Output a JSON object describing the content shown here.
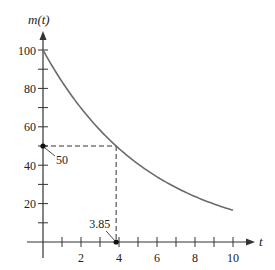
{
  "chart_data": {
    "type": "line",
    "title": "",
    "xlabel": "t",
    "ylabel": "m(t)",
    "xlim": [
      0,
      10
    ],
    "ylim": [
      0,
      100
    ],
    "x_ticks": [
      1,
      2,
      3,
      4,
      5,
      6,
      7,
      8,
      9,
      10
    ],
    "x_tick_labels": [
      "2",
      "4",
      "6",
      "8",
      "10"
    ],
    "x_tick_label_values": [
      2,
      4,
      6,
      8,
      10
    ],
    "y_ticks": [
      10,
      20,
      30,
      40,
      50,
      60,
      70,
      80,
      90,
      100
    ],
    "y_tick_labels": [
      "20",
      "40",
      "60",
      "80",
      "100"
    ],
    "y_tick_label_values": [
      20,
      40,
      60,
      80,
      100
    ],
    "grid": false,
    "series": [
      {
        "name": "m(t)",
        "function": "100 * 0.5^(t/3.85)",
        "x": [
          0,
          1,
          2,
          3,
          3.85,
          5,
          6,
          7,
          8,
          9,
          10
        ],
        "values": [
          100,
          83.5,
          69.8,
          58.3,
          50,
          40.6,
          33.9,
          28.3,
          23.7,
          19.8,
          16.5
        ]
      }
    ],
    "annotations": [
      {
        "text": "50",
        "x": 0,
        "y": 50,
        "note": "point on m-axis where m = 50"
      },
      {
        "text": "3.85",
        "x": 3.85,
        "y": 0,
        "note": "point on t-axis where m(t) = 50"
      }
    ],
    "reference_lines": [
      {
        "type": "dashed",
        "from": [
          0,
          50
        ],
        "to": [
          3.85,
          50
        ]
      },
      {
        "type": "dashed",
        "from": [
          3.85,
          50
        ],
        "to": [
          3.85,
          0
        ]
      }
    ]
  },
  "labels": {
    "y_axis": "m(t)",
    "x_axis": "t",
    "annot_50": "50",
    "annot_385": "3.85"
  }
}
